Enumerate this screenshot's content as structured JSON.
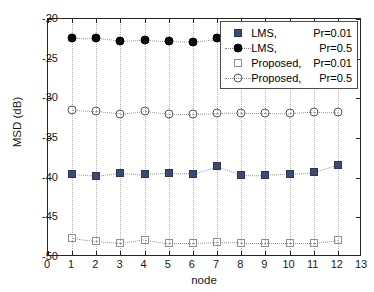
{
  "chart_data": {
    "type": "scatter",
    "title": "",
    "xlabel": "node",
    "ylabel": "MSD (dB)",
    "xlim": [
      0,
      13
    ],
    "ylim": [
      -50,
      -20
    ],
    "xticks": [
      0,
      1,
      2,
      3,
      4,
      5,
      6,
      7,
      8,
      9,
      10,
      11,
      12,
      13
    ],
    "xticklabels": [
      "0",
      "1",
      "2",
      "3",
      "4",
      "5",
      "6",
      "7",
      "8",
      "9",
      "10",
      "11",
      "12",
      "13"
    ],
    "yticks": [
      -20,
      -25,
      -30,
      -35,
      -40,
      -45,
      -50
    ],
    "yticklabels": [
      "-20",
      "-25",
      "-30",
      "-35",
      "-40",
      "-45",
      "-50"
    ],
    "grid": "vertical-dotted",
    "legend_position": "upper-right",
    "x": [
      1,
      2,
      3,
      4,
      5,
      6,
      7,
      8,
      9,
      10,
      11,
      12
    ],
    "series": [
      {
        "name": "LMS,",
        "condition": "Pr=0.01",
        "marker": "filled-square",
        "color": "#3d4a75",
        "values": [
          -39.6,
          -39.8,
          -39.4,
          -39.6,
          -39.45,
          -39.5,
          -38.55,
          -39.65,
          -39.7,
          -39.5,
          -39.3,
          -38.35
        ]
      },
      {
        "name": "LMS,",
        "condition": "Pr=0.5",
        "marker": "filled-circle",
        "color": "#0a0a0a",
        "values": [
          -22.4,
          -22.45,
          -22.75,
          -22.6,
          -22.75,
          -22.85,
          -22.45,
          null,
          null,
          null,
          null,
          null
        ]
      },
      {
        "name": "Proposed,",
        "condition": "Pr=0.01",
        "marker": "open-square",
        "color": "#8e8e9e",
        "values": [
          -47.6,
          -48.0,
          -48.25,
          -47.8,
          -48.25,
          -48.25,
          -48.15,
          -48.2,
          -48.2,
          -48.2,
          -48.2,
          -47.85
        ]
      },
      {
        "name": "Proposed,",
        "condition": "Pr=0.5",
        "marker": "open-circle",
        "color": "#555560",
        "values": [
          -31.5,
          -31.65,
          -31.95,
          -31.6,
          -31.95,
          -31.95,
          -31.85,
          -31.8,
          -31.8,
          -31.85,
          -31.7,
          -31.75
        ]
      }
    ]
  },
  "legend": {
    "items": [
      {
        "name": "LMS,",
        "condition": "Pr=0.01",
        "marker": "filled-square"
      },
      {
        "name": "LMS,",
        "condition": "Pr=0.5",
        "marker": "filled-circle"
      },
      {
        "name": "Proposed,",
        "condition": "Pr=0.01",
        "marker": "open-square"
      },
      {
        "name": "Proposed,",
        "condition": "Pr=0.5",
        "marker": "open-circle"
      }
    ]
  }
}
